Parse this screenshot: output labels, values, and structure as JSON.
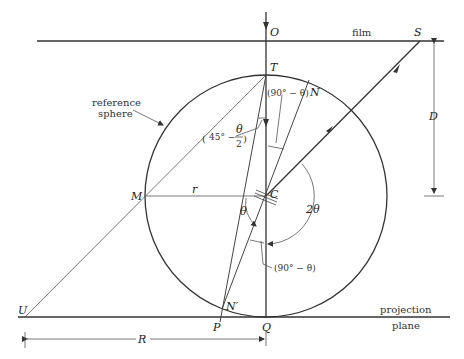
{
  "diagram": {
    "type": "geometry",
    "points": {
      "O": "O",
      "S": "S",
      "T": "T",
      "N": "N",
      "C": "C",
      "M": "M",
      "U": "U",
      "P": "P",
      "N_prime": "N′",
      "Q": "Q"
    },
    "labels": {
      "film": "film",
      "reference_sphere_line1": "reference",
      "reference_sphere_line2": "sphere",
      "projection_line1": "projection",
      "projection_line2": "plane",
      "radius_small": "r",
      "radius_large": "R",
      "distance": "D",
      "angle_theta": "θ",
      "angle_2theta": "2θ",
      "angle_90_minus_theta_top": "(90° − θ)",
      "angle_90_minus_theta_bottom": "(90° − θ)",
      "angle_45_prefix": "45° −",
      "angle_45_num": "θ",
      "angle_45_den": "2"
    },
    "colors": {
      "stroke": "#333333",
      "background": "#ffffff"
    }
  }
}
